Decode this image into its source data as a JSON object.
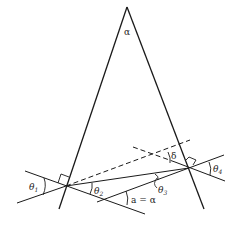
{
  "diagram": {
    "type": "prism-refraction",
    "labels": {
      "apex_angle": "α",
      "theta1": "θ",
      "theta1_sub": "1",
      "theta2": "θ",
      "theta2_sub": "2",
      "theta3": "θ",
      "theta3_sub": "3",
      "theta4": "θ",
      "theta4_sub": "4",
      "delta": "δ",
      "a_equals_alpha": "a = α"
    },
    "colors": {
      "line": "#1a1a1a",
      "background": "#ffffff"
    }
  }
}
